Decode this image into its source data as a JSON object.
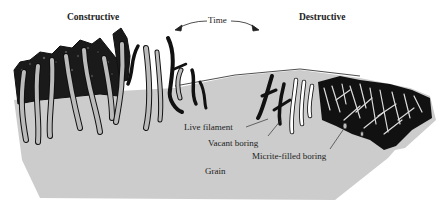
{
  "diagram": {
    "headers": {
      "left": "Constructive",
      "right": "Destructive"
    },
    "time_arrow": {
      "label": "Time",
      "direction": "bidirectional"
    },
    "labels": {
      "live_filament": "Live filament",
      "vacant_boring": "Vacant boring",
      "micrite_filled_boring": "Micrite-filled boring",
      "grain": "Grain"
    },
    "colors": {
      "grain": "#cccccc",
      "filament": "#111111",
      "vacant": "#ffffff",
      "micrite": "#bbbbbb",
      "text": "#222222"
    }
  }
}
